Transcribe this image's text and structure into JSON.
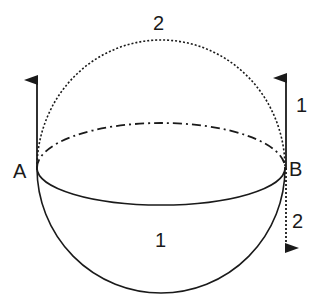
{
  "diagram": {
    "type": "sphere-hemispheres",
    "colors": {
      "stroke": "#1a1a1a",
      "background": "#ffffff"
    },
    "labels": {
      "top_hemisphere": "2",
      "bottom_hemisphere": "1",
      "point_a": "A",
      "point_b": "B",
      "arrow_b_up": "1",
      "arrow_b_down": "2"
    },
    "elements": {
      "upper_arc": {
        "style": "dotted",
        "meaning": "path 2 over top"
      },
      "lower_arc": {
        "style": "solid",
        "meaning": "path 1 under bottom"
      },
      "equator_back": {
        "style": "dash-dot"
      },
      "equator_front": {
        "style": "solid"
      },
      "arrow_a": {
        "direction": "up",
        "style": "solid"
      },
      "arrow_b_1": {
        "direction": "up",
        "style": "solid"
      },
      "arrow_b_2": {
        "direction": "down",
        "style": "dotted"
      }
    }
  }
}
